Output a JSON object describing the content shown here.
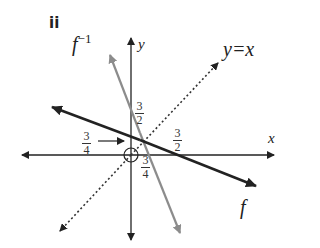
{
  "part_label": "ii",
  "axes": {
    "x_label": "x",
    "y_label": "y"
  },
  "curves": {
    "f": {
      "label": "f",
      "color": "#222222",
      "style": "solid"
    },
    "f_inverse": {
      "label_base": "f",
      "label_sup": "−1",
      "color": "#8c8c8c",
      "style": "solid"
    },
    "identity": {
      "label": "y=x",
      "color": "#333333",
      "style": "dotted"
    }
  },
  "annotations": {
    "f_inverse_y_intercept": {
      "num": "3",
      "den": "2"
    },
    "f_y_intercept": {
      "num": "3",
      "den": "4"
    },
    "f_x_intercept": {
      "num": "3",
      "den": "2"
    },
    "f_inverse_x_intercept": {
      "num": "3",
      "den": "4"
    }
  }
}
